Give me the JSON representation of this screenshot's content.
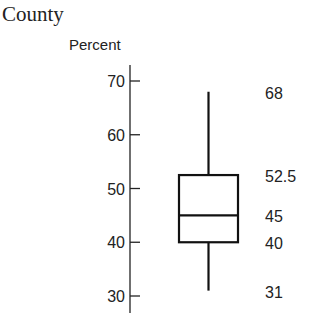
{
  "chart_data": {
    "type": "boxplot",
    "title": "County",
    "ylabel": "Percent",
    "xlabel": "",
    "ylim": [
      28,
      73
    ],
    "yticks": [
      30,
      40,
      50,
      60,
      70
    ],
    "ytick_labels": [
      "30",
      "40",
      "50",
      "60",
      "70"
    ],
    "grid": false,
    "legend": null,
    "box": {
      "min": 31,
      "q1": 40,
      "median": 45,
      "q3": 52.5,
      "max": 68
    },
    "annotations": [
      {
        "stat": "max",
        "value": 68,
        "text": "68"
      },
      {
        "stat": "q3",
        "value": 52.5,
        "text": "52.5"
      },
      {
        "stat": "median",
        "value": 45,
        "text": "45"
      },
      {
        "stat": "q1",
        "value": 40,
        "text": "40"
      },
      {
        "stat": "min",
        "value": 31,
        "text": "31"
      }
    ]
  }
}
